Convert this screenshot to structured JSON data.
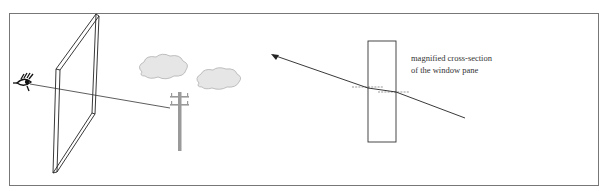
{
  "diagram": {
    "caption": {
      "line1": "magnified cross-section",
      "line2": "of the window pane"
    },
    "elements": {
      "eye": "eye-icon",
      "window_pane": "window-pane",
      "clouds": [
        "cloud-1",
        "cloud-2"
      ],
      "pole": "utility-pole",
      "cross_section": "glass-cross-section",
      "ray": "light-ray-arrow"
    },
    "colors": {
      "frame": "#666666",
      "lines": "#222222",
      "cloud_fill": "#e6e6e6",
      "cloud_stroke": "#b0b0b0",
      "pole": "#999999"
    }
  }
}
